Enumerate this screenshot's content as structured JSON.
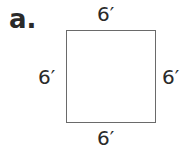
{
  "problem_label": "a.",
  "shape": "square",
  "sides": {
    "top": "6′",
    "bottom": "6′",
    "left": "6′",
    "right": "6′"
  }
}
